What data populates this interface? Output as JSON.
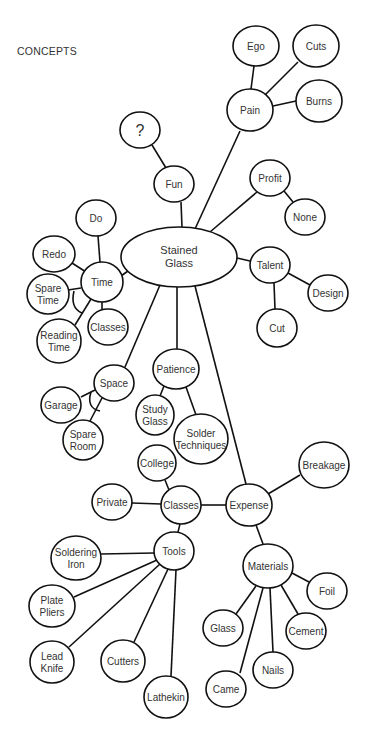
{
  "title": "CONCEPTS",
  "colors": {
    "stroke": "#111111",
    "text": "#333333",
    "background": "#ffffff"
  },
  "nodes": [
    {
      "id": "stained_glass",
      "lines": [
        "Stained",
        "Glass"
      ],
      "cx": 179,
      "cy": 257,
      "rx": 58,
      "ry": 30,
      "big": true
    },
    {
      "id": "pain",
      "lines": [
        "Pain"
      ],
      "cx": 250,
      "cy": 110,
      "rx": 23,
      "ry": 21
    },
    {
      "id": "ego",
      "lines": [
        "Ego"
      ],
      "cx": 256,
      "cy": 46,
      "rx": 23,
      "ry": 20
    },
    {
      "id": "cuts",
      "lines": [
        "Cuts"
      ],
      "cx": 316,
      "cy": 46,
      "rx": 23,
      "ry": 21
    },
    {
      "id": "burns",
      "lines": [
        "Burns"
      ],
      "cx": 319,
      "cy": 101,
      "rx": 23,
      "ry": 21
    },
    {
      "id": "question",
      "lines": [
        "?"
      ],
      "cx": 140,
      "cy": 130,
      "rx": 20,
      "ry": 18,
      "q": true
    },
    {
      "id": "fun",
      "lines": [
        "Fun"
      ],
      "cx": 174,
      "cy": 184,
      "rx": 20,
      "ry": 18
    },
    {
      "id": "profit",
      "lines": [
        "Profit"
      ],
      "cx": 270,
      "cy": 178,
      "rx": 20,
      "ry": 18
    },
    {
      "id": "none",
      "lines": [
        "None"
      ],
      "cx": 305,
      "cy": 217,
      "rx": 20,
      "ry": 18
    },
    {
      "id": "talent",
      "lines": [
        "Talent"
      ],
      "cx": 270,
      "cy": 265,
      "rx": 20,
      "ry": 18
    },
    {
      "id": "design",
      "lines": [
        "Design"
      ],
      "cx": 328,
      "cy": 293,
      "rx": 20,
      "ry": 18
    },
    {
      "id": "cut",
      "lines": [
        "Cut"
      ],
      "cx": 277,
      "cy": 328,
      "rx": 20,
      "ry": 19
    },
    {
      "id": "do",
      "lines": [
        "Do"
      ],
      "cx": 96,
      "cy": 218,
      "rx": 20,
      "ry": 18
    },
    {
      "id": "redo",
      "lines": [
        "Redo"
      ],
      "cx": 54,
      "cy": 254,
      "rx": 21,
      "ry": 18
    },
    {
      "id": "time",
      "lines": [
        "Time"
      ],
      "cx": 102,
      "cy": 282,
      "rx": 21,
      "ry": 20
    },
    {
      "id": "spare_time",
      "lines": [
        "Spare",
        "Time"
      ],
      "cx": 48,
      "cy": 294,
      "rx": 21,
      "ry": 20
    },
    {
      "id": "reading_time",
      "lines": [
        "Reading",
        "Time"
      ],
      "cx": 59,
      "cy": 341,
      "rx": 22,
      "ry": 22
    },
    {
      "id": "classes_time",
      "lines": [
        "Classes"
      ],
      "cx": 108,
      "cy": 327,
      "rx": 20,
      "ry": 18
    },
    {
      "id": "space",
      "lines": [
        "Space"
      ],
      "cx": 114,
      "cy": 383,
      "rx": 20,
      "ry": 18
    },
    {
      "id": "garage",
      "lines": [
        "Garage"
      ],
      "cx": 61,
      "cy": 405,
      "rx": 20,
      "ry": 18
    },
    {
      "id": "spare_room",
      "lines": [
        "Spare",
        "Room"
      ],
      "cx": 83,
      "cy": 440,
      "rx": 20,
      "ry": 20
    },
    {
      "id": "patience",
      "lines": [
        "Patience"
      ],
      "cx": 176,
      "cy": 369,
      "rx": 23,
      "ry": 20
    },
    {
      "id": "study_glass",
      "lines": [
        "Study",
        "Glass"
      ],
      "cx": 155,
      "cy": 415,
      "rx": 19,
      "ry": 20
    },
    {
      "id": "solder_techniques",
      "lines": [
        "Solder",
        "Techniques"
      ],
      "cx": 201,
      "cy": 439,
      "rx": 27,
      "ry": 25
    },
    {
      "id": "college",
      "lines": [
        "College"
      ],
      "cx": 157,
      "cy": 463,
      "rx": 19,
      "ry": 18
    },
    {
      "id": "private",
      "lines": [
        "Private"
      ],
      "cx": 112,
      "cy": 502,
      "rx": 20,
      "ry": 18
    },
    {
      "id": "classes",
      "lines": [
        "Classes"
      ],
      "cx": 181,
      "cy": 505,
      "rx": 20,
      "ry": 19
    },
    {
      "id": "expense",
      "lines": [
        "Expense"
      ],
      "cx": 249,
      "cy": 505,
      "rx": 23,
      "ry": 21
    },
    {
      "id": "breakage",
      "lines": [
        "Breakage"
      ],
      "cx": 324,
      "cy": 465,
      "rx": 25,
      "ry": 23
    },
    {
      "id": "tools",
      "lines": [
        "Tools"
      ],
      "cx": 174,
      "cy": 551,
      "rx": 20,
      "ry": 19
    },
    {
      "id": "soldering_iron",
      "lines": [
        "Soldering",
        "Iron"
      ],
      "cx": 76,
      "cy": 558,
      "rx": 25,
      "ry": 22
    },
    {
      "id": "plate_pliers",
      "lines": [
        "Plate",
        "Pliers"
      ],
      "cx": 52,
      "cy": 606,
      "rx": 23,
      "ry": 21
    },
    {
      "id": "lead_knife",
      "lines": [
        "Lead",
        "Knife"
      ],
      "cx": 52,
      "cy": 662,
      "rx": 22,
      "ry": 21
    },
    {
      "id": "cutters",
      "lines": [
        "Cutters"
      ],
      "cx": 123,
      "cy": 661,
      "rx": 22,
      "ry": 21
    },
    {
      "id": "lathekin",
      "lines": [
        "Lathekin"
      ],
      "cx": 166,
      "cy": 697,
      "rx": 22,
      "ry": 21
    },
    {
      "id": "materials",
      "lines": [
        "Materials"
      ],
      "cx": 268,
      "cy": 566,
      "rx": 25,
      "ry": 22
    },
    {
      "id": "foil",
      "lines": [
        "Foil"
      ],
      "cx": 327,
      "cy": 591,
      "rx": 20,
      "ry": 18
    },
    {
      "id": "glass",
      "lines": [
        "Glass"
      ],
      "cx": 223,
      "cy": 628,
      "rx": 20,
      "ry": 18
    },
    {
      "id": "cement",
      "lines": [
        "Cement"
      ],
      "cx": 306,
      "cy": 631,
      "rx": 20,
      "ry": 18
    },
    {
      "id": "nails",
      "lines": [
        "Nails"
      ],
      "cx": 273,
      "cy": 670,
      "rx": 20,
      "ry": 18
    },
    {
      "id": "came",
      "lines": [
        "Came"
      ],
      "cx": 226,
      "cy": 689,
      "rx": 20,
      "ry": 18
    }
  ],
  "edges": [
    [
      "stained_glass",
      "pain",
      195,
      229,
      240,
      131
    ],
    [
      "pain",
      "ego",
      251,
      89,
      254,
      66
    ],
    [
      "pain",
      "cuts",
      265,
      95,
      298,
      62
    ],
    [
      "pain",
      "burns",
      273,
      106,
      296,
      101
    ],
    [
      "question",
      "fun",
      152,
      145,
      166,
      168
    ],
    [
      "stained_glass",
      "fun",
      182,
      227,
      181,
      202
    ],
    [
      "stained_glass",
      "profit",
      210,
      232,
      257,
      192
    ],
    [
      "profit",
      "none",
      284,
      191,
      293,
      202
    ],
    [
      "stained_glass",
      "talent",
      237,
      258,
      250,
      261
    ],
    [
      "talent",
      "design",
      288,
      273,
      310,
      285
    ],
    [
      "talent",
      "cut",
      274,
      283,
      275,
      309
    ],
    [
      "stained_glass",
      "time",
      128,
      271,
      121,
      276
    ],
    [
      "time",
      "do",
      100,
      262,
      98,
      236
    ],
    [
      "time",
      "redo",
      86,
      272,
      72,
      263
    ],
    [
      "time",
      "spare_time",
      81,
      288,
      68,
      290
    ],
    [
      "time",
      "reading_time",
      91,
      299,
      75,
      325
    ],
    [
      "time",
      "classes_time",
      102,
      302,
      102,
      310
    ],
    [
      "stained_glass",
      "space",
      160,
      285,
      125,
      367
    ],
    [
      "space",
      "garage",
      95,
      390,
      81,
      397
    ],
    [
      "space",
      "spare_room",
      102,
      398,
      90,
      421
    ],
    [
      "stained_glass",
      "patience",
      177,
      287,
      177,
      349
    ],
    [
      "patience",
      "study_glass",
      164,
      386,
      160,
      396
    ],
    [
      "patience",
      "solder_techniques",
      186,
      387,
      196,
      415
    ],
    [
      "stained_glass",
      "expense",
      195,
      286,
      246,
      484
    ],
    [
      "classes",
      "college",
      169,
      490,
      165,
      480
    ],
    [
      "classes",
      "private",
      161,
      504,
      132,
      503
    ],
    [
      "classes",
      "expense",
      201,
      505,
      226,
      505
    ],
    [
      "expense",
      "breakage",
      268,
      494,
      300,
      475
    ],
    [
      "expense",
      "materials",
      256,
      525,
      263,
      544
    ],
    [
      "classes",
      "tools",
      180,
      524,
      178,
      532
    ],
    [
      "tools",
      "soldering_iron",
      154,
      553,
      101,
      554
    ],
    [
      "tools",
      "plate_pliers",
      157,
      560,
      74,
      597
    ],
    [
      "tools",
      "lead_knife",
      160,
      564,
      69,
      647
    ],
    [
      "tools",
      "cutters",
      168,
      569,
      134,
      642
    ],
    [
      "tools",
      "lathekin",
      176,
      570,
      171,
      676
    ],
    [
      "materials",
      "foil",
      292,
      573,
      309,
      582
    ],
    [
      "materials",
      "glass",
      256,
      586,
      236,
      614
    ],
    [
      "materials",
      "came",
      263,
      588,
      240,
      673
    ],
    [
      "materials",
      "nails",
      270,
      588,
      273,
      652
    ],
    [
      "materials",
      "cement",
      281,
      585,
      298,
      614
    ]
  ],
  "arcs": [
    {
      "id": "time_and_arc",
      "d": "M 74 291 Q 70 308 82 313"
    },
    {
      "id": "space_and_arc",
      "d": "M 91 392 Q 86 408 100 411"
    }
  ]
}
